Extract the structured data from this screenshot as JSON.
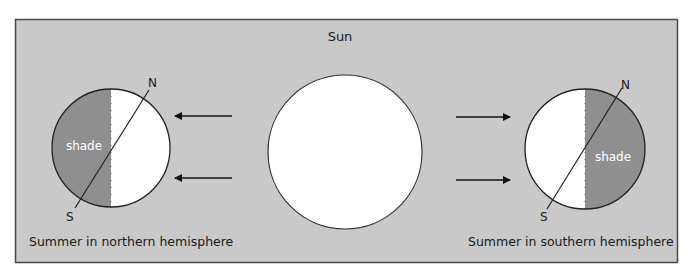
{
  "diagram": {
    "sun_label": "Sun",
    "left_earth": {
      "north_label": "N",
      "south_label": "S",
      "shade_label": "shade",
      "caption": "Summer in northern hemisphere"
    },
    "right_earth": {
      "north_label": "N",
      "south_label": "S",
      "shade_label": "shade",
      "caption": "Summer in southern hemisphere"
    },
    "colors": {
      "background": "#c9c9c9",
      "shade": "#8f8f8f",
      "lit": "#ffffff",
      "stroke": "#222222"
    }
  }
}
